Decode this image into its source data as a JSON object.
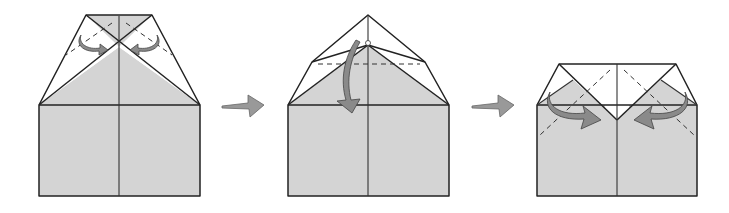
{
  "diagram": {
    "type": "origami-instruction-sequence",
    "colors": {
      "paper_back": "#d4d4d4",
      "paper_front": "#ffffff",
      "line": "#222222",
      "arrow_fill": "#8a8a8a",
      "step_arrow_fill": "#999999"
    },
    "steps": [
      {
        "index": 1,
        "description": "Square with top corners folded to center; fold the top triangle flaps inward to the center line",
        "fold_arrows": [
          "curved arrow left flap to center",
          "curved arrow right flap to center"
        ],
        "line_types": [
          "solid edges",
          "dashed valley folds",
          "center crease"
        ]
      },
      {
        "index": 2,
        "description": "Fold the top point down along the dashed horizontal line",
        "fold_arrows": [
          "curved arrow top point folding down"
        ],
        "line_types": [
          "solid edges",
          "dashed horizontal valley fold",
          "center crease"
        ]
      },
      {
        "index": 3,
        "description": "Fold the side corners inward along the dashed diagonal lines",
        "fold_arrows": [
          "curved arrow left corner inward",
          "curved arrow right corner inward"
        ],
        "line_types": [
          "solid edges",
          "dashed diagonal valley folds",
          "center crease"
        ]
      }
    ],
    "transitions": [
      {
        "from": 1,
        "to": 2,
        "symbol": "right-arrow"
      },
      {
        "from": 2,
        "to": 3,
        "symbol": "right-arrow"
      }
    ]
  }
}
